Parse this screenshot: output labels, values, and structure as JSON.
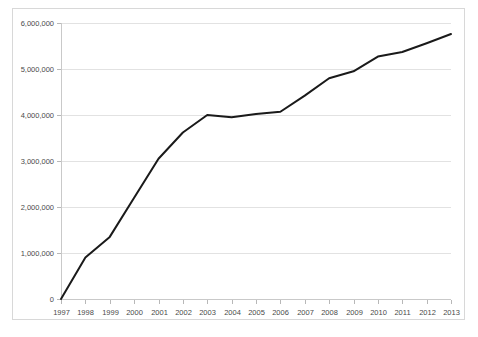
{
  "chart_data": {
    "type": "line",
    "title": "",
    "subtitle": "",
    "xlabel": "",
    "ylabel": "",
    "categories": [
      "1997",
      "1998",
      "1999",
      "2000",
      "2001",
      "2002",
      "2003",
      "2004",
      "2005",
      "2006",
      "2007",
      "2008",
      "2009",
      "2010",
      "2011",
      "2012",
      "2013"
    ],
    "series": [
      {
        "name": "",
        "values": [
          0,
          900000,
          1350000,
          2200000,
          3050000,
          3620000,
          4000000,
          3950000,
          4020000,
          4070000,
          4420000,
          4800000,
          4950000,
          5270000,
          5370000,
          5560000,
          5760000
        ]
      }
    ],
    "ylim": [
      0,
      6000000
    ],
    "ytick_values": [
      0,
      1000000,
      2000000,
      3000000,
      4000000,
      5000000,
      6000000
    ],
    "ytick_labels": [
      "0",
      "1,000,000",
      "2,000,000",
      "3,000,000",
      "4,000,000",
      "5,000,000",
      "6,000,000"
    ],
    "xtick_labels": [
      "1997",
      "1998",
      "1999",
      "2000",
      "2001",
      "2002",
      "2003",
      "2004",
      "2005",
      "2006",
      "2007",
      "2008",
      "2009",
      "2010",
      "2011",
      "2012",
      "2013"
    ],
    "grid": "horizontal",
    "legend": "none",
    "line_color": "#1a1a1a",
    "grid_color": "#e2e2e2",
    "axis_color": "#c9c9c9",
    "tick_label_color": "#4a4a4a",
    "background_color": "#ffffff",
    "border_color": "#d8d8d8",
    "annotations": []
  }
}
